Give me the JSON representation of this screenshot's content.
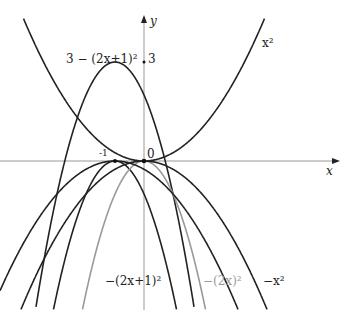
{
  "chart_data": {
    "type": "line",
    "title": "",
    "xlabel": "x",
    "ylabel": "y",
    "xlim": [
      -2.5,
      3.6
    ],
    "ylim": [
      -5,
      4.9
    ],
    "grid": false,
    "ticks": {
      "x": [
        "-1/2",
        "0"
      ],
      "y": [
        "3"
      ]
    },
    "series": [
      {
        "name": "x^2",
        "label": "x²",
        "formula": "x^2",
        "color": "#222222"
      },
      {
        "name": "3-(2x+1)^2",
        "label": "3 − (2x+1)²",
        "formula": "3-(2x+1)^2",
        "color": "#222222"
      },
      {
        "name": "-(2x+1)^2",
        "label": "−(2x+1)²",
        "formula": "-(2x+1)^2",
        "color": "#222222"
      },
      {
        "name": "-(2x)^2",
        "label": "−(2x)²",
        "formula": "-(2x)^2",
        "color": "#999999"
      },
      {
        "name": "-x^2",
        "label": "−x²",
        "formula": "-x^2",
        "color": "#222222"
      },
      {
        "name": "-(x+1/2)^2",
        "label": "",
        "formula": "-(x+0.5)^2",
        "color": "#222222"
      }
    ],
    "annotations": [
      {
        "text": "3 − (2x+1)²",
        "x": -0.5,
        "y": 3.0
      },
      {
        "text": "x²",
        "x": 2.1,
        "y": 4.2
      },
      {
        "text": "−(2x+1)²",
        "x": -0.3,
        "y": -4.0
      },
      {
        "text": "−(2x)²",
        "x": 1.1,
        "y": -4.0
      },
      {
        "text": "−x²",
        "x": 2.2,
        "y": -4.0
      }
    ]
  },
  "labels": {
    "y_axis": "y",
    "x_axis": "x",
    "tick_three": "3",
    "tick_zero": "0",
    "tick_half_num": "1",
    "tick_half_den": "2",
    "curve_a": "3 − (2x+1)²",
    "curve_x2": "x²",
    "curve_b": "−(2x+1)²",
    "curve_c": "−(2x)²",
    "curve_d": "−x²"
  }
}
